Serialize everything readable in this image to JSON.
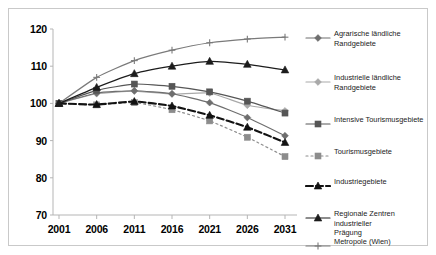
{
  "chart_data": {
    "type": "line",
    "title": "",
    "subtitle": "",
    "xlabel": "",
    "ylabel": "",
    "x": [
      2001,
      2006,
      2011,
      2016,
      2021,
      2026,
      2031
    ],
    "xtick_labels": [
      "2001",
      "2006",
      "2011",
      "2016",
      "2021",
      "2026",
      "2031"
    ],
    "ytick_labels": [
      "120",
      "110",
      "100",
      "90",
      "80",
      "70"
    ],
    "ylim": [
      70,
      120
    ],
    "ytick_step": 10,
    "grid": false,
    "legend_position": "right",
    "series": [
      {
        "name": "Agrarische ländliche Randgebiete",
        "label_lines": [
          "Agrarische ländliche",
          "Randgebiete"
        ],
        "marker": "diamond",
        "color": "#6e6e6e",
        "dash": "solid",
        "values": [
          100,
          102.8,
          103.4,
          102.6,
          100.2,
          96.2,
          91.3
        ]
      },
      {
        "name": "Industrielle ländliche Randgebiete",
        "label_lines": [
          "Industrielle ländliche",
          "Randgebiete"
        ],
        "marker": "diamond",
        "color": "#a9a9a9",
        "dash": "solid",
        "values": [
          100,
          102.6,
          103.3,
          102.5,
          102.8,
          99.5,
          98.0
        ]
      },
      {
        "name": "Intensive Tourismusgebiete",
        "label_lines": [
          "Intensive Tourismusgebiete"
        ],
        "marker": "square",
        "color": "#565656",
        "dash": "solid",
        "values": [
          100,
          103.5,
          105.2,
          104.6,
          103.1,
          100.6,
          97.4
        ]
      },
      {
        "name": "Tourismusgebiete",
        "label_lines": [
          "Tourismusgebiete"
        ],
        "marker": "square",
        "color": "#8c8c8c",
        "dash": "dotted",
        "values": [
          100,
          99.6,
          100.2,
          98.3,
          95.3,
          90.9,
          85.7
        ]
      },
      {
        "name": "Industriegebiete",
        "label_lines": [
          "Industriegebiete"
        ],
        "marker": "triangle",
        "color": "#121212",
        "dash": "dashed",
        "values": [
          100,
          99.7,
          100.5,
          99.3,
          96.8,
          93.6,
          89.5
        ]
      },
      {
        "name": "Regionale Zentren industrieller Prägung",
        "label_lines": [
          "Regionale Zentren industrieller",
          "Prägung"
        ],
        "marker": "triangle",
        "color": "#1c1c1c",
        "dash": "solid",
        "values": [
          100,
          104.3,
          108.0,
          110.0,
          111.3,
          110.5,
          109.0
        ]
      },
      {
        "name": "Metropole (Wien)",
        "label_lines": [
          "Metropole (Wien)"
        ],
        "marker": "plus",
        "color": "#7a7a7a",
        "dash": "solid",
        "values": [
          100,
          107.0,
          111.5,
          114.3,
          116.3,
          117.3,
          117.8
        ]
      }
    ]
  },
  "colors": {
    "frame": "#c9c9c9",
    "axis": "#b5b5b5",
    "text": "#000000",
    "background": "#ffffff"
  }
}
